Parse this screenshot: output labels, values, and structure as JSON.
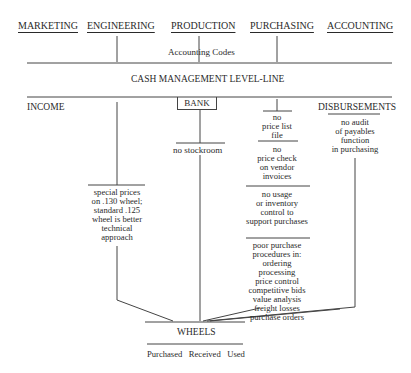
{
  "departments": [
    "MARKETING",
    "ENGINEERING",
    "PRODUCTION",
    "PURCHASING",
    "ACCOUNTING"
  ],
  "accounting_codes": "Accounting Codes",
  "level_line": "CASH MANAGEMENT LEVEL-LINE",
  "categories": {
    "income": "INCOME",
    "bank": "BANK",
    "disbursements": "DISBURSEMENTS"
  },
  "engineering_note": [
    "special prices",
    "on .130 wheel;",
    "standard .125",
    "wheel is better",
    "technical",
    "approach"
  ],
  "bank_note": "no stockroom",
  "purchasing_notes": [
    [
      "no",
      "price list",
      "file"
    ],
    [
      "no",
      "price check",
      "on vendor",
      "invoices"
    ],
    [
      "no usage",
      "or inventory",
      "control to",
      "support purchases"
    ],
    [
      "poor purchase",
      "procedures in:",
      "ordering",
      "processing",
      "price control",
      "competitive bids",
      "value analysis",
      "freight losses",
      "purchase orders"
    ]
  ],
  "disbursements_note": [
    "no audit",
    "of payables",
    "function",
    "in purchasing"
  ],
  "wheels": {
    "title": "WHEELS",
    "subtitle": "Purchased   Received   Used"
  },
  "colors": {
    "line": "#444444",
    "text": "#2a2a2a"
  }
}
